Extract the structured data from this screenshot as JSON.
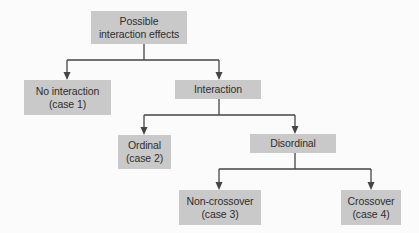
{
  "diagram": {
    "type": "tree",
    "colors": {
      "node_fill": "#c9c9c9",
      "line": "#454545",
      "text": "#2e2e2e",
      "background": "#fbfbfb"
    },
    "nodes": {
      "root": {
        "line1": "Possible",
        "line2": "interaction effects"
      },
      "no_interaction": {
        "line1": "No interaction",
        "line2": "(case 1)"
      },
      "interaction": {
        "line1": "Interaction"
      },
      "ordinal": {
        "line1": "Ordinal",
        "line2": "(case 2)"
      },
      "disordinal": {
        "line1": "Disordinal"
      },
      "non_crossover": {
        "line1": "Non-crossover",
        "line2": "(case 3)"
      },
      "crossover": {
        "line1": "Crossover",
        "line2": "(case 4)"
      }
    },
    "edges": [
      {
        "from": "root",
        "to": "no_interaction"
      },
      {
        "from": "root",
        "to": "interaction"
      },
      {
        "from": "interaction",
        "to": "ordinal"
      },
      {
        "from": "interaction",
        "to": "disordinal"
      },
      {
        "from": "disordinal",
        "to": "non_crossover"
      },
      {
        "from": "disordinal",
        "to": "crossover"
      }
    ]
  }
}
